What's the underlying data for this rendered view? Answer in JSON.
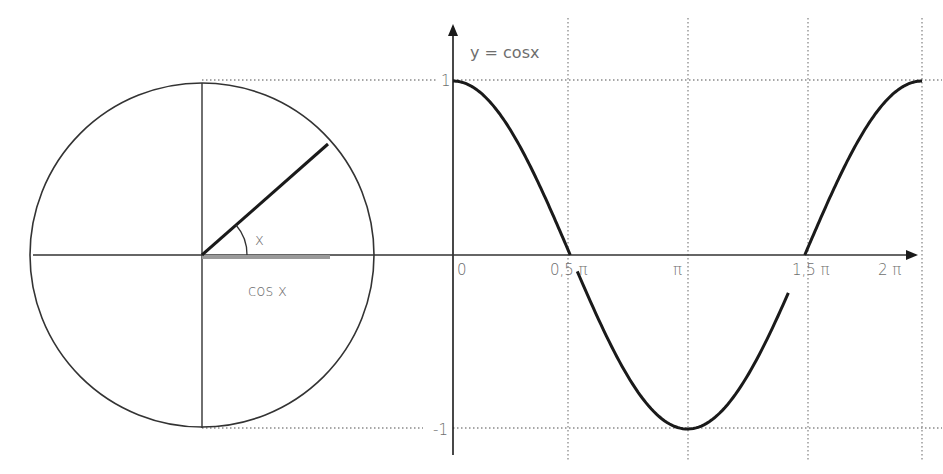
{
  "diagram": {
    "circle": {
      "center": [
        202,
        255
      ],
      "radius": 172,
      "angle_label": "x",
      "projection_label": "cos x",
      "angle_deg": 35
    },
    "graph": {
      "function_label": "y = cosx",
      "y_ticks": [
        {
          "label": "1",
          "value": 1
        },
        {
          "label": "-1",
          "value": -1
        }
      ],
      "x_ticks": [
        {
          "label": "0",
          "value": 0
        },
        {
          "label": "0,5 π",
          "value": 0.5
        },
        {
          "label": "π",
          "value": 1
        },
        {
          "label": "1,5 π",
          "value": 1.5
        },
        {
          "label": "2 π",
          "value": 2
        }
      ]
    },
    "colors": {
      "line": "#1a1a1a",
      "axis": "#333333",
      "grid": "#8a8a8a",
      "projection": "#9a9a9a",
      "text": "#6e6e6e"
    }
  },
  "chart_data": {
    "type": "line",
    "title": "y = cosx",
    "xlabel": "",
    "ylabel": "",
    "x_unit": "pi",
    "x": [
      0,
      0.25,
      0.5,
      0.75,
      1.0,
      1.25,
      1.5,
      1.75,
      2.0
    ],
    "series": [
      {
        "name": "cos x",
        "values": [
          1,
          0.707,
          0,
          -0.707,
          -1,
          -0.707,
          0,
          0.707,
          1
        ]
      }
    ],
    "x_tick_labels": [
      "0",
      "0,5 π",
      "π",
      "1,5 π",
      "2 π"
    ],
    "y_tick_labels": [
      "1",
      "-1"
    ],
    "xlim": [
      0,
      2
    ],
    "ylim": [
      -1,
      1
    ],
    "grid": "dotted vertical lines at 0.5π, π, 1.5π, 2π and dotted horizontal lines at y=1 and y=-1",
    "legend": "none"
  }
}
